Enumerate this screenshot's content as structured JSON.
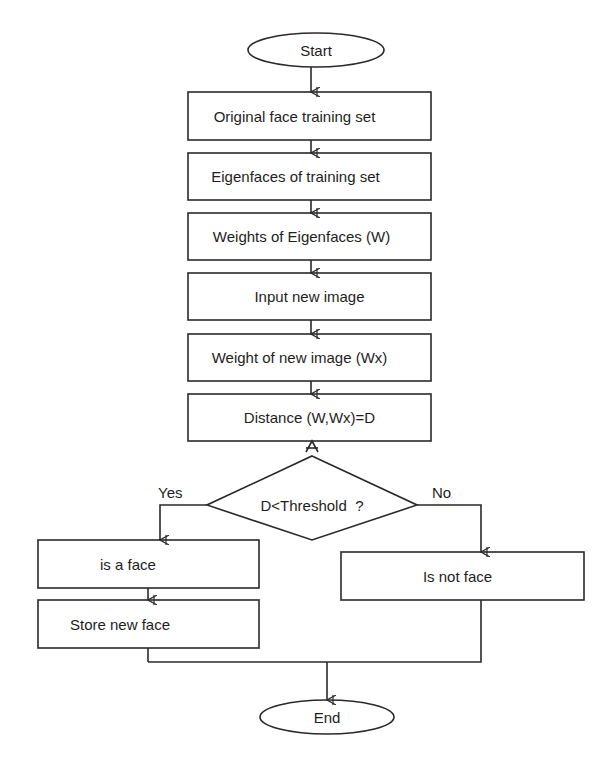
{
  "diagram": {
    "type": "flowchart",
    "nodes": {
      "start": {
        "label": "Start",
        "shape": "terminator"
      },
      "original_set": {
        "label": "Original face training set",
        "shape": "process"
      },
      "eigenfaces": {
        "label": "Eigenfaces of training set",
        "shape": "process"
      },
      "weights": {
        "label": "Weights of Eigenfaces (W)",
        "shape": "process"
      },
      "input_image": {
        "label": "Input new image",
        "shape": "process"
      },
      "weight_new": {
        "label": "Weight of new image (Wx)",
        "shape": "process"
      },
      "distance": {
        "label": "Distance (W,Wx)=D",
        "shape": "process"
      },
      "decision": {
        "label": "D<Threshold  ?",
        "shape": "decision"
      },
      "is_face": {
        "label": "is a face",
        "shape": "process"
      },
      "store_face": {
        "label": "Store new face",
        "shape": "process"
      },
      "not_face": {
        "label": "Is not face",
        "shape": "process"
      },
      "end": {
        "label": "End",
        "shape": "terminator"
      }
    },
    "edge_labels": {
      "yes": "Yes",
      "no": "No"
    },
    "edges": [
      {
        "from": "start",
        "to": "original_set"
      },
      {
        "from": "original_set",
        "to": "eigenfaces"
      },
      {
        "from": "eigenfaces",
        "to": "weights"
      },
      {
        "from": "weights",
        "to": "input_image"
      },
      {
        "from": "input_image",
        "to": "weight_new"
      },
      {
        "from": "weight_new",
        "to": "distance"
      },
      {
        "from": "decision",
        "to": "distance"
      },
      {
        "from": "decision",
        "to": "is_face",
        "label": "Yes"
      },
      {
        "from": "decision",
        "to": "not_face",
        "label": "No"
      },
      {
        "from": "is_face",
        "to": "store_face"
      },
      {
        "from": "store_face",
        "to": "end"
      },
      {
        "from": "not_face",
        "to": "end"
      }
    ],
    "colors": {
      "stroke": "#2a2a2a",
      "text": "#1e1e1e",
      "background": "#ffffff"
    }
  }
}
